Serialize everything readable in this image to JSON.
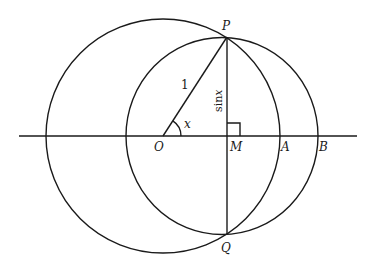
{
  "diagram": {
    "points": {
      "P": {
        "label": "P",
        "x": 227,
        "y": 37
      },
      "Q": {
        "label": "Q",
        "x": 227,
        "y": 234
      },
      "O": {
        "label": "O",
        "x": 163,
        "y": 136
      },
      "M": {
        "label": "M",
        "x": 227,
        "y": 136
      },
      "A": {
        "label": "A",
        "x": 279,
        "y": 136
      },
      "B": {
        "label": "B",
        "x": 318,
        "y": 136
      }
    },
    "segment_labels": {
      "OP": "1",
      "PM": "sin",
      "PM_var": "x",
      "angle": "x"
    },
    "circles": [
      {
        "name": "large-circle-centered-O",
        "cx": 163,
        "cy": 136,
        "r": 117
      },
      {
        "name": "small-circle-centered-M",
        "cx": 222,
        "cy": 136,
        "rx": 96,
        "ry": 98
      }
    ],
    "axis": {
      "x1": 19,
      "x2": 357,
      "y": 136
    },
    "colors": {
      "ink": "#1a1a1a",
      "background": "#ffffff"
    }
  }
}
